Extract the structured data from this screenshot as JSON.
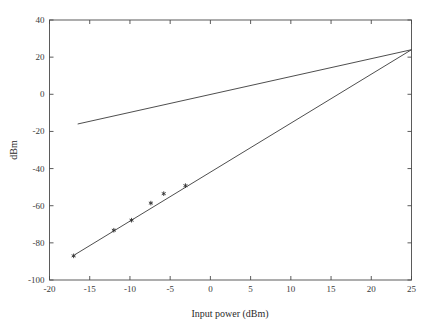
{
  "chart_data": {
    "type": "line",
    "title": "",
    "xlabel": "Input power (dBm)",
    "ylabel": "dBm",
    "xlim": [
      -20,
      25
    ],
    "ylim": [
      -100,
      40
    ],
    "xticks": [
      -20,
      -15,
      -10,
      -5,
      0,
      5,
      10,
      15,
      20,
      25
    ],
    "xticklabels": [
      "-20",
      "-15",
      "-10",
      "-5",
      "0",
      "5",
      "10",
      "15",
      "20",
      "25"
    ],
    "yticks": [
      -100,
      -80,
      -60,
      -40,
      -20,
      0,
      20,
      40
    ],
    "yticklabels": [
      "-100",
      "-80",
      "-60",
      "-40",
      "-20",
      "0",
      "20",
      "40"
    ],
    "grid": false,
    "legend": "none",
    "series": [
      {
        "name": "fundamental-extrapolation",
        "type": "line",
        "slope": 1,
        "x": [
          -16.5,
          25
        ],
        "y": [
          -16.0,
          24.0
        ]
      },
      {
        "name": "third-order-extrapolation",
        "type": "line",
        "slope": 3,
        "x": [
          -16.9,
          25
        ],
        "y": [
          -86.5,
          24.0
        ]
      },
      {
        "name": "measured-third-order-points",
        "type": "scatter",
        "marker": "asterisk",
        "x": [
          -17.0,
          -12.0,
          -9.8,
          -7.4,
          -5.8,
          -3.1
        ],
        "y": [
          -87.0,
          -73.2,
          -67.8,
          -58.6,
          -53.5,
          -49.2
        ]
      }
    ],
    "intercept_point": {
      "x": 25,
      "y": 24
    }
  },
  "labels": {
    "x_axis_title": "Input power (dBm)",
    "y_axis_title": "dBm"
  }
}
